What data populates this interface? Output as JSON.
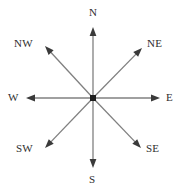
{
  "figure": {
    "name": "compass-rose",
    "width": 185,
    "height": 193,
    "background_color": "#ffffff",
    "center": {
      "x": 93,
      "y": 98
    },
    "center_dot_color": "#1f1f1f",
    "ray_color": "#808080",
    "arrowhead_color": "#3a3a3a",
    "label_color": "#2e2e2e"
  },
  "directions": [
    {
      "id": "north",
      "label": "N",
      "bearing_deg": 0,
      "tip": {
        "x": 93,
        "y": 27
      },
      "label_pos": {
        "x": 89,
        "y": 7
      }
    },
    {
      "id": "northeast",
      "label": "NE",
      "bearing_deg": 45,
      "tip": {
        "x": 142,
        "y": 48
      },
      "label_pos": {
        "x": 147,
        "y": 38
      }
    },
    {
      "id": "east",
      "label": "E",
      "bearing_deg": 90,
      "tip": {
        "x": 160,
        "y": 98
      },
      "label_pos": {
        "x": 166,
        "y": 92
      }
    },
    {
      "id": "southeast",
      "label": "SE",
      "bearing_deg": 135,
      "tip": {
        "x": 141,
        "y": 148
      },
      "label_pos": {
        "x": 146,
        "y": 143
      }
    },
    {
      "id": "south",
      "label": "S",
      "bearing_deg": 180,
      "tip": {
        "x": 93,
        "y": 168
      },
      "label_pos": {
        "x": 89,
        "y": 174
      }
    },
    {
      "id": "southwest",
      "label": "SW",
      "bearing_deg": 225,
      "tip": {
        "x": 45,
        "y": 148
      },
      "label_pos": {
        "x": 16,
        "y": 143
      }
    },
    {
      "id": "west",
      "label": "W",
      "bearing_deg": 270,
      "tip": {
        "x": 26,
        "y": 98
      },
      "label_pos": {
        "x": 8,
        "y": 92
      }
    },
    {
      "id": "northwest",
      "label": "NW",
      "bearing_deg": 315,
      "tip": {
        "x": 45,
        "y": 46
      },
      "label_pos": {
        "x": 14,
        "y": 38
      }
    }
  ]
}
